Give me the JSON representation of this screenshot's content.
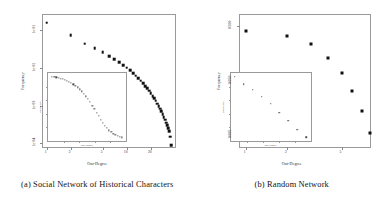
{
  "figure": {
    "panels": [
      {
        "id": "social-network",
        "caption": "(a)  Social Network of Historical Characters",
        "caption_label": "(a)",
        "caption_text": "Social Network of Historical Characters",
        "main": {
          "xlabel": "Out-Degree",
          "ylabel": "Frequency",
          "xticks": [
            "1",
            "2",
            "5",
            "10",
            "20"
          ],
          "yticks": [
            "1e-01",
            "1e-02",
            "1e-03",
            "1e-04"
          ]
        },
        "inset": {
          "xlabel": "Out-Degree",
          "ylabel": "Frequency"
        }
      },
      {
        "id": "random-network",
        "caption": "(b)  Random Network",
        "caption_label": "(b)",
        "caption_text": "Random Network",
        "main": {
          "xlabel": "Out-Degree",
          "ylabel": "Frequency",
          "xticks": [
            "1",
            "2",
            "5"
          ],
          "yticks": [
            "0.500",
            "0.050",
            "0.005"
          ]
        },
        "inset": {
          "xlabel": "Out-Degree",
          "ylabel": "Frequency"
        }
      }
    ]
  },
  "chart_data": [
    {
      "type": "scatter",
      "title": "(a) Social Network of Historical Characters",
      "xlabel": "Out-Degree",
      "ylabel": "Frequency",
      "xscale": "log",
      "yscale": "log",
      "xlim": [
        0.9,
        40
      ],
      "ylim": [
        8e-05,
        0.25
      ],
      "xticks": [
        1,
        2,
        5,
        10,
        20
      ],
      "xticklabels": [
        "1",
        "2",
        "5",
        "10",
        "20"
      ],
      "yticks": [
        0.1,
        0.01,
        0.001,
        0.0001
      ],
      "yticklabels": [
        "1e-01",
        "1e-02",
        "1e-03",
        "1e-04"
      ],
      "grid": false,
      "legend": null,
      "x": [
        1,
        2,
        3,
        4,
        5,
        6,
        7,
        8,
        9,
        10,
        11,
        12,
        13,
        14,
        15,
        16,
        17,
        18,
        19,
        20,
        21,
        22,
        23,
        24,
        25,
        26,
        27,
        28,
        29,
        30,
        31,
        32,
        33,
        34,
        35,
        36
      ],
      "y": [
        0.155,
        0.072,
        0.044,
        0.033,
        0.026,
        0.0205,
        0.0168,
        0.0139,
        0.0118,
        0.01,
        0.0085,
        0.0072,
        0.0062,
        0.0053,
        0.0045,
        0.0039,
        0.0033,
        0.0029,
        0.0025,
        0.0021,
        0.0018,
        0.00155,
        0.00133,
        0.00113,
        0.00097,
        0.00082,
        0.0007,
        0.00059,
        0.0005,
        0.00042,
        0.00035,
        0.0003,
        0.00025,
        0.00021,
        0.00015,
        9e-05
      ]
    },
    {
      "type": "scatter",
      "title": "(a) inset — linear-scale degree distribution",
      "xlabel": "Out-Degree",
      "ylabel": "Frequency",
      "xscale": "linear",
      "yscale": "linear",
      "inset_of": "social-network",
      "grid": false,
      "x": [
        1,
        2,
        3,
        4,
        5,
        6,
        7,
        8,
        9,
        10,
        11,
        12,
        13,
        14,
        15,
        16,
        17,
        18,
        19,
        20,
        21,
        22,
        23,
        24,
        25,
        26,
        27,
        28,
        29,
        30,
        31,
        32,
        33,
        34
      ],
      "y": [
        0.97,
        0.965,
        0.958,
        0.95,
        0.94,
        0.93,
        0.918,
        0.905,
        0.89,
        0.872,
        0.85,
        0.826,
        0.8,
        0.77,
        0.735,
        0.7,
        0.66,
        0.615,
        0.565,
        0.51,
        0.455,
        0.4,
        0.345,
        0.29,
        0.24,
        0.195,
        0.155,
        0.12,
        0.09,
        0.065,
        0.045,
        0.03,
        0.018,
        0.008
      ]
    },
    {
      "type": "scatter",
      "title": "(b) Random Network",
      "xlabel": "Out-Degree",
      "ylabel": "Frequency",
      "xscale": "log",
      "yscale": "log",
      "xlim": [
        0.9,
        8
      ],
      "ylim": [
        0.003,
        0.8
      ],
      "xticks": [
        1,
        2,
        5
      ],
      "xticklabels": [
        "1",
        "2",
        "5"
      ],
      "yticks": [
        0.5,
        0.05,
        0.005
      ],
      "yticklabels": [
        "0.500",
        "0.050",
        "0.005"
      ],
      "grid": false,
      "legend": null,
      "x": [
        1,
        2,
        3,
        4,
        5,
        6,
        7,
        8
      ],
      "y": [
        0.4,
        0.33,
        0.23,
        0.13,
        0.068,
        0.032,
        0.014,
        0.0055
      ]
    },
    {
      "type": "scatter",
      "title": "(b) inset — linear-scale degree distribution",
      "xlabel": "Out-Degree",
      "ylabel": "Frequency",
      "xscale": "linear",
      "yscale": "linear",
      "inset_of": "random-network",
      "grid": false,
      "x": [
        1,
        2,
        3,
        4,
        5,
        6,
        7,
        8,
        9
      ],
      "y": [
        0.97,
        0.86,
        0.78,
        0.68,
        0.58,
        0.45,
        0.33,
        0.2,
        0.09
      ]
    }
  ]
}
